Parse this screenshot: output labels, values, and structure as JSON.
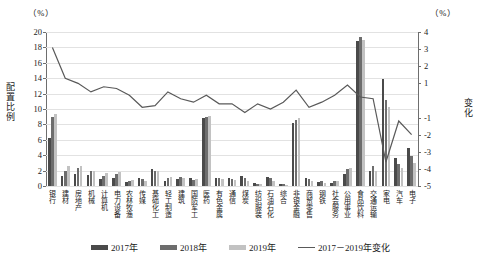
{
  "axes": {
    "left_unit": "（%）",
    "right_unit": "（%）",
    "left_title": "配置比例",
    "right_title": "变化",
    "left_ticks": [
      "0",
      "2",
      "4",
      "6",
      "8",
      "10",
      "12",
      "14",
      "16",
      "18",
      "20"
    ],
    "right_ticks": [
      "-5",
      "-4",
      "-3",
      "-2",
      "-1",
      "1",
      "2",
      "3",
      "4"
    ]
  },
  "legend": [
    {
      "label": "2017年",
      "color": "#4a4a4a",
      "type": "bar"
    },
    {
      "label": "2018年",
      "color": "#6d6d6d",
      "type": "bar"
    },
    {
      "label": "2019年",
      "color": "#c2c2c2",
      "type": "bar"
    },
    {
      "label": "2017－2019年变化",
      "color": "#595959",
      "type": "line"
    }
  ],
  "chart_data": {
    "type": "bar",
    "title": "",
    "xlabel": "",
    "ylabel": "配置比例",
    "ylabel_right": "变化",
    "ylim": [
      0,
      20
    ],
    "ylim_right": [
      -5,
      4
    ],
    "grid": true,
    "legend_position": "bottom",
    "categories": [
      "银行",
      "建材",
      "房地产",
      "机械",
      "计算机",
      "电力设备",
      "农林牧渔",
      "传媒",
      "基础化工",
      "轻工制造",
      "建筑",
      "国防军工",
      "医药",
      "有色金属",
      "通信",
      "煤炭",
      "纺织服装",
      "石油石化",
      "综合",
      "非银金融",
      "商贸零售",
      "钢铁",
      "社会服务",
      "公用事业",
      "食品饮料",
      "交通运输",
      "家电",
      "汽车",
      "电子"
    ],
    "series": [
      {
        "name": "2017年",
        "color": "#4a4a4a",
        "values": [
          6.2,
          1.3,
          1.6,
          1.4,
          0.9,
          1.1,
          0.5,
          1.1,
          2.2,
          0.7,
          0.9,
          1.0,
          8.8,
          1.1,
          1.0,
          1.3,
          0.4,
          1.2,
          0.2,
          8.2,
          1.1,
          0.5,
          0.4,
          1.5,
          18.8,
          1.9,
          13.9,
          3.6,
          5.0
        ]
      },
      {
        "name": "2018年",
        "color": "#6d6d6d",
        "values": [
          9.0,
          2.0,
          2.3,
          1.9,
          1.3,
          1.5,
          0.7,
          0.9,
          2.0,
          1.1,
          1.2,
          0.8,
          9.0,
          1.0,
          0.9,
          1.0,
          0.3,
          1.0,
          0.2,
          8.6,
          0.9,
          0.6,
          0.6,
          2.2,
          19.3,
          2.6,
          11.2,
          2.8,
          3.9
        ]
      },
      {
        "name": "2019年",
        "color": "#c2c2c2",
        "values": [
          9.3,
          2.6,
          2.6,
          1.9,
          1.7,
          1.8,
          0.8,
          0.7,
          1.9,
          1.2,
          1.0,
          0.9,
          9.1,
          0.9,
          0.8,
          0.6,
          0.2,
          0.7,
          0.1,
          8.8,
          0.7,
          0.4,
          0.7,
          2.4,
          19.0,
          2.0,
          10.3,
          2.4,
          3.0
        ]
      }
    ],
    "line_series": {
      "name": "2017－2019年变化",
      "color": "#595959",
      "axis": "right",
      "values": [
        3.1,
        1.3,
        1.0,
        0.5,
        0.8,
        0.7,
        0.3,
        -0.4,
        -0.3,
        0.5,
        0.1,
        -0.1,
        0.3,
        -0.2,
        -0.2,
        -0.7,
        -0.2,
        -0.5,
        -0.1,
        0.6,
        -0.4,
        -0.1,
        0.3,
        0.9,
        0.2,
        0.1,
        -3.6,
        -1.2,
        -2.0
      ]
    }
  }
}
